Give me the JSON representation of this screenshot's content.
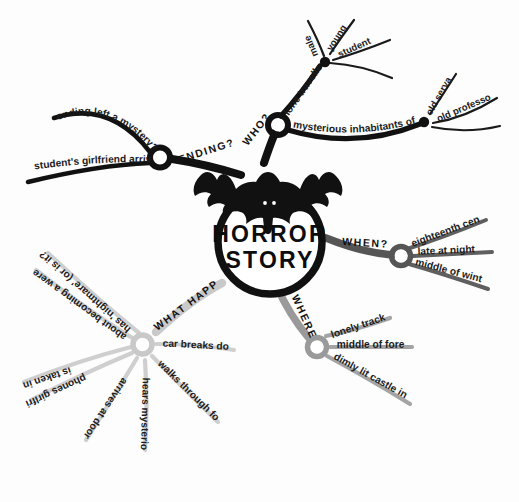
{
  "canvas": {
    "width": 519,
    "height": 502,
    "background": "#fdfdfd"
  },
  "center": {
    "title_line1": "HORROR",
    "title_line2": "STORY",
    "icon": "bat-icon",
    "ring_color": "#111111"
  },
  "colors": {
    "ending": "#111111",
    "who": "#111111",
    "when": "#555555",
    "where": "#9a9a9a",
    "what_happens": "#c9c9c9",
    "text": "#1c1c1c"
  },
  "branches": [
    {
      "id": "ending",
      "label": "ENDING?",
      "color": "#111111",
      "children": [
        {
          "label": "ending left a mystery?"
        },
        {
          "label": "student's girlfriend arrives"
        }
      ]
    },
    {
      "id": "who",
      "label": "WHO?",
      "color": "#111111",
      "children": [
        {
          "label": "lone traveller",
          "children": [
            {
              "label": "male"
            },
            {
              "label": "young"
            },
            {
              "label": "student"
            }
          ]
        },
        {
          "label": "mysterious inhabitants of castle",
          "children": [
            {
              "label": "old servant"
            },
            {
              "label": "old professor"
            }
          ]
        }
      ]
    },
    {
      "id": "when",
      "label": "WHEN?",
      "color": "#555555",
      "children": [
        {
          "label": "eighteenth century"
        },
        {
          "label": "late at night"
        },
        {
          "label": "middle of winter"
        }
      ]
    },
    {
      "id": "where",
      "label": "WHERE?",
      "color": "#9a9a9a",
      "children": [
        {
          "label": "lonely track"
        },
        {
          "label": "middle of forest"
        },
        {
          "label": "dimly lit castle in distance"
        }
      ]
    },
    {
      "id": "what-happens",
      "label": "WHAT HAPPENS?",
      "color": "#c9c9c9",
      "children": [
        {
          "label": "has 'nightmare' (or is it?)"
        },
        {
          "label": "about becoming a werewolf"
        },
        {
          "label": "is taken in"
        },
        {
          "label": "phones girlfriend"
        },
        {
          "label": "arrives at door of castle"
        },
        {
          "label": "hears mysterious howls"
        },
        {
          "label": "walks through forest"
        },
        {
          "label": "car breaks down"
        }
      ]
    }
  ]
}
